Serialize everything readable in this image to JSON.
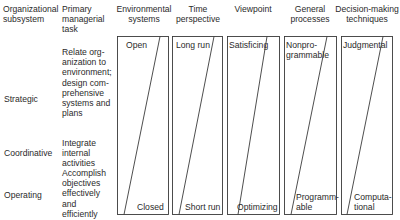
{
  "headers": {
    "subsystem": [
      "Organizational",
      "subsystem"
    ],
    "task": [
      "Primary",
      "managerial",
      "task"
    ],
    "environmental": [
      "Environmental",
      "systems"
    ],
    "time": [
      "Time",
      "perspective"
    ],
    "viewpoint": [
      "Viewpoint"
    ],
    "processes": [
      "General",
      "processes"
    ],
    "decision": [
      "Decision-making",
      "techniques"
    ]
  },
  "rows": [
    {
      "subsystem": "Strategic",
      "task": [
        "Relate org-",
        "anization to",
        "environment;",
        "design com-",
        "prehensive",
        "systems and",
        "plans"
      ]
    },
    {
      "subsystem": "Coordinative",
      "task": [
        "Integrate",
        "internal",
        "activities"
      ]
    },
    {
      "subsystem": "Operating",
      "task": [
        "Accomplish",
        "objectives",
        "effectively",
        "and",
        "efficiently"
      ]
    }
  ],
  "continua": [
    {
      "name": "environmental-systems",
      "top": [
        "Open"
      ],
      "bottom": [
        "Closed"
      ]
    },
    {
      "name": "time-perspective",
      "top": [
        "Long run"
      ],
      "bottom": [
        "Short run"
      ]
    },
    {
      "name": "viewpoint",
      "top": [
        "Satisficing"
      ],
      "bottom": [
        "Optimizing"
      ]
    },
    {
      "name": "general-processes",
      "top": [
        "Nonpro-",
        "grammable"
      ],
      "bottom": [
        "Programm-",
        "able"
      ]
    },
    {
      "name": "decision-making-techniques",
      "top": [
        "Judgmental"
      ],
      "bottom": [
        "Computa-",
        "tional"
      ]
    }
  ],
  "colors": {
    "line": "#3a3a3a",
    "text": "#2a2a2a"
  }
}
